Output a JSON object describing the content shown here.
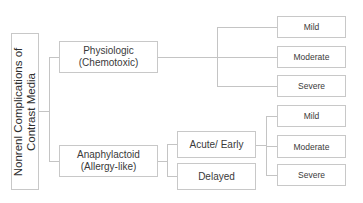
{
  "root": {
    "label_line1": "Nonrenl Complications of",
    "label_line2": "Contrast Media"
  },
  "branches": [
    {
      "label_line1": "Physiologic",
      "label_line2": "(Chemotoxic)",
      "severities": [
        "Mild",
        "Moderate",
        "Severe"
      ]
    },
    {
      "label_line1": "Anaphylactoid",
      "label_line2": "(Allergy-like)",
      "subtypes": [
        {
          "label": "Acute/ Early",
          "severities": [
            "Mild",
            "Moderate",
            "Severe"
          ]
        },
        {
          "label": "Delayed"
        }
      ]
    }
  ]
}
